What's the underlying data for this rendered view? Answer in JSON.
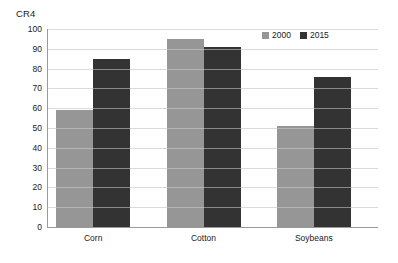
{
  "chart_data": {
    "type": "bar",
    "title": "",
    "subtitle": "",
    "xlabel": "",
    "ylabel": "CR4",
    "ylim": [
      0,
      100
    ],
    "ytick_step": 10,
    "yticks": [
      100,
      90,
      80,
      70,
      60,
      50,
      40,
      30,
      20,
      10,
      0
    ],
    "ytick_labels": [
      "100",
      "90",
      "80",
      "70",
      "60",
      "50",
      "40",
      "30",
      "20",
      "10",
      "0"
    ],
    "grid": "horizontal",
    "legend_position": "top-right",
    "categories": [
      "Corn",
      "Cotton",
      "Soybeans"
    ],
    "series": [
      {
        "name": "2000",
        "color": "#969696",
        "values": [
          59,
          95,
          51
        ]
      },
      {
        "name": "2015",
        "color": "#333333",
        "values": [
          85,
          91,
          76
        ]
      }
    ]
  },
  "legend": {
    "entries": [
      {
        "label": "2000",
        "swatch": "legend-swatch-2000"
      },
      {
        "label": "2015",
        "swatch": "legend-swatch-2015"
      }
    ]
  },
  "colors": {
    "series_2000": "#969696",
    "series_2015": "#333333",
    "axis": "#9a9a9a",
    "gridline": "#e2e2e2",
    "text": "#1a1a1a",
    "background": "#ffffff"
  }
}
